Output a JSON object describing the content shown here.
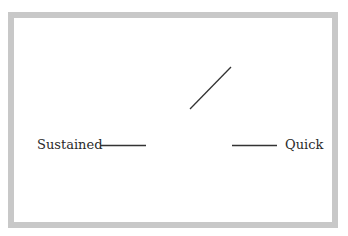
{
  "diagram": {
    "type": "switch",
    "contacts": {
      "left": {
        "label": "Sustained"
      },
      "right": {
        "label": "Quick"
      }
    },
    "colors": {
      "frame": "#c8c8c8",
      "line": "#333333",
      "background": "#ffffff"
    }
  }
}
